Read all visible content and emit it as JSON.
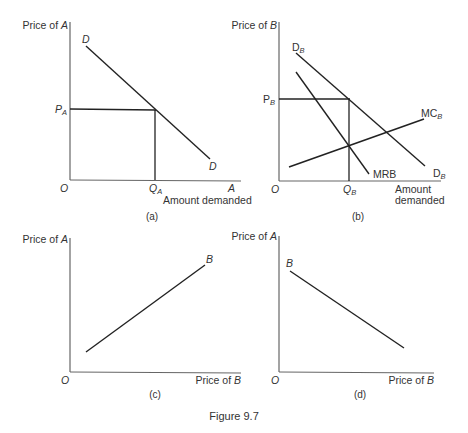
{
  "figure_title": "Figure 9.7",
  "panels": {
    "a": {
      "caption": "(a)",
      "y_label_prefix": "Price of ",
      "y_label_var": "A",
      "x_label_end": "A",
      "x_label": "Amount demanded",
      "origin": "O",
      "curve_label_top": "D",
      "curve_label_bottom": "D",
      "price_mark": "P",
      "price_mark_sub": "A",
      "qty_mark": "Q",
      "qty_mark_sub": "A"
    },
    "b": {
      "caption": "(b)",
      "y_label_prefix": "Price of ",
      "y_label_var": "B",
      "x_label_line1": "Amount",
      "x_label_line2": "demanded",
      "origin": "O",
      "demand_label": "D",
      "demand_sub": "B",
      "mr_label": "MRB",
      "mc_label": "MC",
      "mc_sub": "B",
      "price_mark": "P",
      "price_mark_sub": "B",
      "qty_mark": "Q",
      "qty_mark_sub": "B"
    },
    "c": {
      "caption": "(c)",
      "y_label_prefix": "Price of ",
      "y_label_var": "A",
      "x_label_prefix": "Price of ",
      "x_label_var": "B",
      "origin": "O",
      "curve_label": "B"
    },
    "d": {
      "caption": "(d)",
      "y_label_prefix": "Price of ",
      "y_label_var": "A",
      "x_label_prefix": "Price of ",
      "x_label_var": "B",
      "origin": "O",
      "curve_label": "B"
    }
  },
  "colors": {
    "axis": "#666666",
    "curve": "#222222",
    "text": "#333333",
    "background": "#ffffff"
  }
}
